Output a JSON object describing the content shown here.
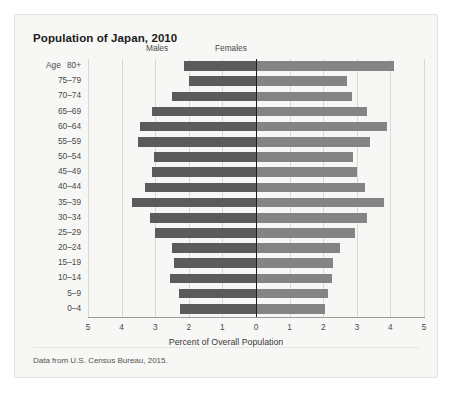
{
  "card": {
    "title": "Population of Japan, 2010",
    "source_note": "Data from U.S. Census Bureau, 2015."
  },
  "axis": {
    "age_header": "Age",
    "xlabel": "Percent of Overall Population",
    "xticks": [
      "5",
      "4",
      "3",
      "2",
      "1",
      "0",
      "1",
      "2",
      "3",
      "4",
      "5"
    ]
  },
  "legend": {
    "males": "Males",
    "females": "Females"
  },
  "colors": {
    "male_bar": "#5b5b5b",
    "female_bar": "#848484",
    "zero_line": "#1d1d1d",
    "gridline": "#d8d8d4",
    "card_background": "#f7f7f5"
  },
  "chart_data": {
    "type": "bar",
    "subtype": "population-pyramid",
    "title": "Population of Japan, 2010",
    "xlabel": "Percent of Overall Population",
    "ylabel": "Age",
    "xlim": [
      -5,
      5
    ],
    "xtick_values": [
      5,
      4,
      3,
      2,
      1,
      0,
      1,
      2,
      3,
      4,
      5
    ],
    "grid": true,
    "legend_position": "top",
    "units": "percent of overall population",
    "note": "Data from U.S. Census Bureau, 2015.",
    "categories": [
      "80+",
      "75–79",
      "70–74",
      "65–69",
      "60–64",
      "55–59",
      "50–54",
      "45–49",
      "40–44",
      "35–39",
      "30–34",
      "25–29",
      "20–24",
      "15–19",
      "10–14",
      "5–9",
      "0–4"
    ],
    "series": [
      {
        "name": "Males",
        "direction": "left",
        "values": [
          2.15,
          2.0,
          2.5,
          3.1,
          3.45,
          3.5,
          3.05,
          3.1,
          3.3,
          3.7,
          3.15,
          3.0,
          2.5,
          2.45,
          2.55,
          2.3,
          2.25
        ]
      },
      {
        "name": "Females",
        "direction": "right",
        "values": [
          4.1,
          2.7,
          2.85,
          3.3,
          3.9,
          3.4,
          2.9,
          3.0,
          3.25,
          3.8,
          3.3,
          2.95,
          2.5,
          2.3,
          2.25,
          2.15,
          2.05
        ]
      }
    ]
  }
}
